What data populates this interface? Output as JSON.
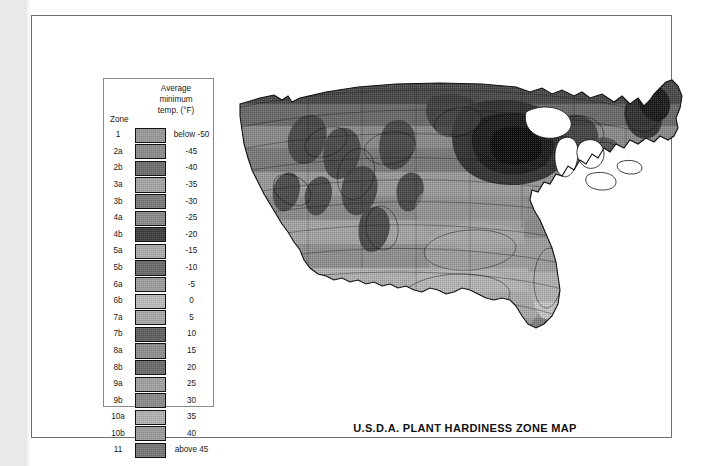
{
  "document": {
    "title": "U.S.D.A. PLANT HARDINESS ZONE MAP",
    "page_background": "#ffffff",
    "left_margin_band_color": "#e9e9e9",
    "plate_border_color": "#6e6e72"
  },
  "legend": {
    "header_line1": "Average",
    "header_line2": "minimum",
    "header_line3": "temp. (°F)",
    "zone_caption": "Zone",
    "border_color": "#8a8a8e",
    "rows": [
      {
        "zone": "1",
        "temp": "below -50",
        "color": "#9a9a9a"
      },
      {
        "zone": "2a",
        "temp": "-45",
        "color": "#8d8d8d"
      },
      {
        "zone": "2b",
        "temp": "-40",
        "color": "#6d6d6d"
      },
      {
        "zone": "3a",
        "temp": "-35",
        "color": "#a6a6a6"
      },
      {
        "zone": "3b",
        "temp": "-30",
        "color": "#7b7b7b"
      },
      {
        "zone": "4a",
        "temp": "-25",
        "color": "#8a8a8a"
      },
      {
        "zone": "4b",
        "temp": "-20",
        "color": "#3c3c3c"
      },
      {
        "zone": "5a",
        "temp": "-15",
        "color": "#aeaeae"
      },
      {
        "zone": "5b",
        "temp": "-10",
        "color": "#6a6a6a"
      },
      {
        "zone": "6a",
        "temp": "-5",
        "color": "#9e9e9e"
      },
      {
        "zone": "6b",
        "temp": "0",
        "color": "#bdbdbd"
      },
      {
        "zone": "7a",
        "temp": "5",
        "color": "#a9a9a9"
      },
      {
        "zone": "7b",
        "temp": "10",
        "color": "#5f5f5f"
      },
      {
        "zone": "8a",
        "temp": "15",
        "color": "#8f8f8f"
      },
      {
        "zone": "8b",
        "temp": "20",
        "color": "#6b6b6b"
      },
      {
        "zone": "9a",
        "temp": "25",
        "color": "#a2a2a2"
      },
      {
        "zone": "9b",
        "temp": "30",
        "color": "#8b8b8b"
      },
      {
        "zone": "10a",
        "temp": "35",
        "color": "#b4b4b4"
      },
      {
        "zone": "10b",
        "temp": "40",
        "color": "#9d9d9d"
      },
      {
        "zone": "11",
        "temp": "above 45",
        "color": "#777777"
      }
    ]
  },
  "map": {
    "region": "Contiguous United States",
    "style": "grayscale halftone zone contours",
    "water_color": "#ffffff",
    "outline_color": "#111111",
    "zone_bands": [
      "#3c3c3c",
      "#4a4a4a",
      "#5a5a5a",
      "#6a6a6a",
      "#7a7a7a",
      "#8a8a8a",
      "#9a9a9a",
      "#a8a8a8",
      "#b6b6b6",
      "#c4c4c4"
    ]
  },
  "chart_data": {
    "type": "heatmap",
    "title": "U.S.D.A. PLANT HARDINESS ZONE MAP",
    "xlabel": "",
    "ylabel": "",
    "legend_title": "Average minimum temp. (°F)",
    "categories": [
      "1",
      "2a",
      "2b",
      "3a",
      "3b",
      "4a",
      "4b",
      "5a",
      "5b",
      "6a",
      "6b",
      "7a",
      "7b",
      "8a",
      "8b",
      "9a",
      "9b",
      "10a",
      "10b",
      "11"
    ],
    "values": [
      -55,
      -45,
      -40,
      -35,
      -30,
      -25,
      -20,
      -15,
      -10,
      -5,
      0,
      5,
      10,
      15,
      20,
      25,
      30,
      35,
      40,
      45
    ],
    "tick_labels": [
      "below -50",
      "-45",
      "-40",
      "-35",
      "-30",
      "-25",
      "-20",
      "-15",
      "-10",
      "-5",
      "0",
      "5",
      "10",
      "15",
      "20",
      "25",
      "30",
      "35",
      "40",
      "above 45"
    ],
    "colors": [
      "#9a9a9a",
      "#8d8d8d",
      "#6d6d6d",
      "#a6a6a6",
      "#7b7b7b",
      "#8a8a8a",
      "#3c3c3c",
      "#aeaeae",
      "#6a6a6a",
      "#9e9e9e",
      "#bdbdbd",
      "#a9a9a9",
      "#5f5f5f",
      "#8f8f8f",
      "#6b6b6b",
      "#a2a2a2",
      "#8b8b8b",
      "#b4b4b4",
      "#9d9d9d",
      "#777777"
    ],
    "legend_position": "left",
    "grid": false
  }
}
